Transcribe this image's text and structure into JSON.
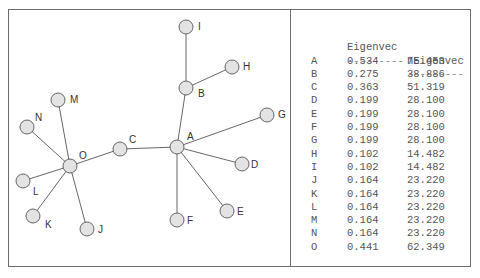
{
  "graph": {
    "nodes": [
      {
        "id": "A",
        "x": 177,
        "y": 147,
        "lx": 187,
        "ly": 140
      },
      {
        "id": "B",
        "x": 186,
        "y": 88,
        "lx": 198,
        "ly": 97
      },
      {
        "id": "C",
        "x": 120,
        "y": 149,
        "lx": 129,
        "ly": 143
      },
      {
        "id": "D",
        "x": 242,
        "y": 164,
        "lx": 251,
        "ly": 168
      },
      {
        "id": "E",
        "x": 227,
        "y": 211,
        "lx": 237,
        "ly": 215
      },
      {
        "id": "F",
        "x": 177,
        "y": 220,
        "lx": 187,
        "ly": 224
      },
      {
        "id": "G",
        "x": 267,
        "y": 115,
        "lx": 278,
        "ly": 118
      },
      {
        "id": "H",
        "x": 232,
        "y": 67,
        "lx": 243,
        "ly": 70
      },
      {
        "id": "I",
        "x": 186,
        "y": 27,
        "lx": 198,
        "ly": 30
      },
      {
        "id": "J",
        "x": 87,
        "y": 229,
        "lx": 98,
        "ly": 233
      },
      {
        "id": "K",
        "x": 33,
        "y": 216,
        "lx": 45,
        "ly": 228
      },
      {
        "id": "L",
        "x": 23,
        "y": 181,
        "lx": 33,
        "ly": 195
      },
      {
        "id": "M",
        "x": 58,
        "y": 100,
        "lx": 70,
        "ly": 103
      },
      {
        "id": "N",
        "x": 27,
        "y": 127,
        "lx": 35,
        "ly": 121
      },
      {
        "id": "O",
        "x": 70,
        "y": 166,
        "lx": 79,
        "ly": 159
      }
    ],
    "edges": [
      [
        "A",
        "B"
      ],
      [
        "B",
        "I"
      ],
      [
        "B",
        "H"
      ],
      [
        "A",
        "G"
      ],
      [
        "A",
        "D"
      ],
      [
        "A",
        "E"
      ],
      [
        "A",
        "F"
      ],
      [
        "A",
        "C"
      ],
      [
        "C",
        "O"
      ],
      [
        "O",
        "M"
      ],
      [
        "O",
        "N"
      ],
      [
        "O",
        "L"
      ],
      [
        "O",
        "K"
      ],
      [
        "O",
        "J"
      ]
    ]
  },
  "table": {
    "headers": [
      "",
      "Eigenvec",
      "nEigenvec"
    ],
    "dashes": [
      "",
      "---------",
      "---------"
    ],
    "rows": [
      {
        "node": "A",
        "eigenvec": "0.534",
        "neigenvec": "75.453"
      },
      {
        "node": "B",
        "eigenvec": "0.275",
        "neigenvec": "38.886"
      },
      {
        "node": "C",
        "eigenvec": "0.363",
        "neigenvec": "51.319"
      },
      {
        "node": "D",
        "eigenvec": "0.199",
        "neigenvec": "28.100"
      },
      {
        "node": "E",
        "eigenvec": "0.199",
        "neigenvec": "28.100"
      },
      {
        "node": "F",
        "eigenvec": "0.199",
        "neigenvec": "28.100"
      },
      {
        "node": "G",
        "eigenvec": "0.199",
        "neigenvec": "28.100"
      },
      {
        "node": "H",
        "eigenvec": "0.102",
        "neigenvec": "14.482"
      },
      {
        "node": "I",
        "eigenvec": "0.102",
        "neigenvec": "14.482"
      },
      {
        "node": "J",
        "eigenvec": "0.164",
        "neigenvec": "23.220"
      },
      {
        "node": "K",
        "eigenvec": "0.164",
        "neigenvec": "23.220"
      },
      {
        "node": "L",
        "eigenvec": "0.164",
        "neigenvec": "23.220"
      },
      {
        "node": "M",
        "eigenvec": "0.164",
        "neigenvec": "23.220"
      },
      {
        "node": "N",
        "eigenvec": "0.164",
        "neigenvec": "23.220"
      },
      {
        "node": "O",
        "eigenvec": "0.441",
        "neigenvec": "62.349"
      }
    ]
  }
}
